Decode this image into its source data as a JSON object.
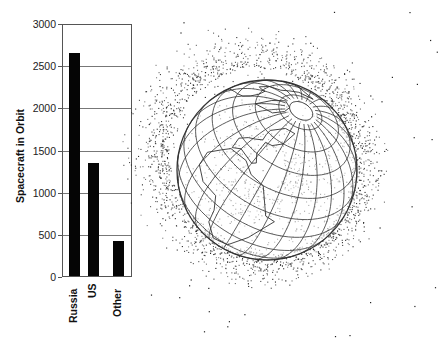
{
  "chart_data": {
    "type": "bar",
    "title": "",
    "xlabel": "",
    "ylabel": "Spacecraft in Orbit",
    "categories": [
      "Russia",
      "US",
      "Other"
    ],
    "values": [
      2650,
      1340,
      420
    ],
    "ylim": [
      0,
      3000
    ],
    "yticks": [
      0,
      500,
      1000,
      1500,
      2000,
      2500,
      3000
    ],
    "grid": true,
    "legend": null,
    "bar_color": "#050505"
  },
  "illustration": {
    "subject": "globe-with-orbital-debris",
    "line_color": "#333333",
    "dot_color": "#222222",
    "center": [
      267,
      170
    ],
    "radius": 90,
    "tilt_deg": 40,
    "rotation_deg": -30
  }
}
